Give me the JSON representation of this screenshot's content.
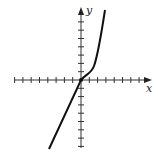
{
  "chart_data": {
    "type": "line",
    "title": "",
    "xlabel": "x",
    "ylabel": "y",
    "grid": false,
    "x_ticks": 8,
    "y_ticks": 8
  },
  "axes": {
    "x_label": "x",
    "y_label": "y"
  }
}
